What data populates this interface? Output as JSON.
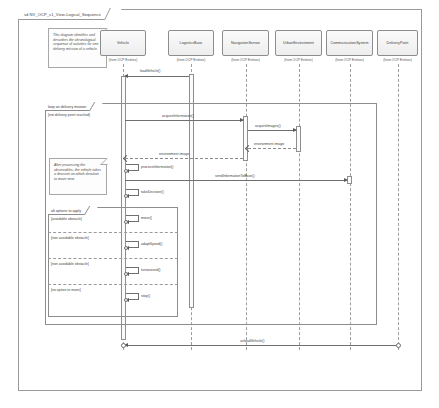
{
  "diagram": {
    "frame_label": "sd NV_OCP_s1_View-Logical_Sequence",
    "notes": [
      {
        "id": "note-overview",
        "text": "This diagram identifies and describes the chronological sequence of activities for one delivery mission of a vehicle."
      },
      {
        "id": "note-decision",
        "text": "After processing the observables, the vehicle takes a decision on which direction to move next."
      }
    ],
    "lifelines": [
      {
        "name": "Vehicle",
        "stereotype": "(from OCP Entities)"
      },
      {
        "name": "LogisticsBase",
        "stereotype": "(from OCP Entities)"
      },
      {
        "name": "NavigationSensor",
        "stereotype": "(from OCP Entities)"
      },
      {
        "name": "UrbanEnvironment",
        "stereotype": "(from OCP Entities)"
      },
      {
        "name": "CommunicationSystem",
        "stereotype": "(from OCP Entities)"
      },
      {
        "name": "DeliveryPoint",
        "stereotype": "(from OCP Entities)"
      }
    ],
    "fragments": [
      {
        "id": "loop-delivery-mission",
        "operator": "loop",
        "label": "loop on delivery mission",
        "guard": "[not delivery point reached]"
      },
      {
        "id": "alt-options-to-apply",
        "operator": "alt",
        "label": "alt options to apply",
        "guards": [
          "[avoidable obstacle]",
          "[non avoidable obstacle]",
          "[non avoidable obstacle]",
          "[no option to move]"
        ]
      }
    ],
    "messages": [
      {
        "id": "m-loadvehicle",
        "label": "loadVehicle()",
        "kind": "sync",
        "from": "LogisticsBase",
        "to": "Vehicle"
      },
      {
        "id": "m-acquireinformation",
        "label": "acquireInformation()",
        "kind": "sync",
        "from": "Vehicle",
        "to": "NavigationSensor"
      },
      {
        "id": "m-acquireimages",
        "label": "acquireImages()",
        "kind": "sync",
        "from": "NavigationSensor",
        "to": "UrbanEnvironment"
      },
      {
        "id": "m-environmentimage",
        "label": "environment image",
        "kind": "return",
        "from": "UrbanEnvironment",
        "to": "NavigationSensor"
      },
      {
        "id": "m-environmentimage-2",
        "label": "environment image",
        "kind": "return",
        "from": "NavigationSensor",
        "to": "Vehicle"
      },
      {
        "id": "m-processinformation",
        "label": "processInformation()",
        "kind": "self",
        "from": "Vehicle",
        "to": "Vehicle"
      },
      {
        "id": "m-sendinformation",
        "label": "sendInformationToBase()",
        "kind": "sync",
        "from": "Vehicle",
        "to": "CommunicationSystem"
      },
      {
        "id": "m-takedecision",
        "label": "takeDecision()",
        "kind": "self",
        "from": "Vehicle",
        "to": "Vehicle"
      },
      {
        "id": "m-move",
        "label": "move()",
        "kind": "self",
        "from": "Vehicle",
        "to": "Vehicle"
      },
      {
        "id": "m-adaptspeed",
        "label": "adaptSpeed()",
        "kind": "self",
        "from": "Vehicle",
        "to": "Vehicle"
      },
      {
        "id": "m-turnaround",
        "label": "turnaround()",
        "kind": "self",
        "from": "Vehicle",
        "to": "Vehicle"
      },
      {
        "id": "m-stop",
        "label": "stop()",
        "kind": "self",
        "from": "Vehicle",
        "to": "Vehicle"
      },
      {
        "id": "m-unloadvehicle",
        "label": "unloadVehicle()",
        "kind": "sync",
        "from": "DeliveryPoint",
        "to": "Vehicle"
      }
    ]
  }
}
